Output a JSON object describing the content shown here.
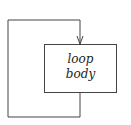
{
  "diagram": {
    "type": "flowchart-loop",
    "nodes": [
      {
        "id": "loop-body",
        "line1": "loop",
        "line2": "body"
      }
    ],
    "edges": [
      {
        "from": "loop-body",
        "to": "loop-body",
        "kind": "back-edge",
        "arrow": "into top of box"
      }
    ],
    "colors": {
      "stroke": "#444444",
      "background": "#ffffff",
      "text": "#222222"
    }
  }
}
